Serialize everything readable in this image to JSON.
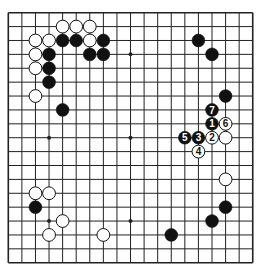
{
  "board": {
    "size": 19,
    "origin_x": 8.3,
    "origin_y": 12.7,
    "spacing_x": 13.58,
    "spacing_y": 13.89,
    "line_color": "#222222",
    "border_width": 1.6,
    "line_width": 1.0,
    "background": "#ffffff",
    "stone_radius": 6.4
  },
  "hoshi": [
    {
      "col": 3,
      "row": 3
    },
    {
      "col": 9,
      "row": 3
    },
    {
      "col": 15,
      "row": 3
    },
    {
      "col": 3,
      "row": 9
    },
    {
      "col": 9,
      "row": 9
    },
    {
      "col": 15,
      "row": 9
    },
    {
      "col": 3,
      "row": 15
    },
    {
      "col": 9,
      "row": 15
    },
    {
      "col": 15,
      "row": 15
    }
  ],
  "colors": {
    "black_stone": "#111111",
    "white_stone": "#ffffff",
    "white_stroke": "#111111",
    "black_label": "#ffffff",
    "white_label": "#111111"
  },
  "stones": [
    {
      "color": "white",
      "col": 4,
      "row": 1,
      "label": ""
    },
    {
      "color": "white",
      "col": 5,
      "row": 1,
      "label": ""
    },
    {
      "color": "white",
      "col": 6,
      "row": 1,
      "label": ""
    },
    {
      "color": "white",
      "col": 2,
      "row": 2,
      "label": ""
    },
    {
      "color": "white",
      "col": 3,
      "row": 2,
      "label": ""
    },
    {
      "color": "black",
      "col": 4,
      "row": 2,
      "label": ""
    },
    {
      "color": "black",
      "col": 5,
      "row": 2,
      "label": ""
    },
    {
      "color": "white",
      "col": 6,
      "row": 2,
      "label": ""
    },
    {
      "color": "black",
      "col": 7,
      "row": 2,
      "label": ""
    },
    {
      "color": "white",
      "col": 2,
      "row": 3,
      "label": ""
    },
    {
      "color": "black",
      "col": 3,
      "row": 3,
      "label": ""
    },
    {
      "color": "black",
      "col": 6,
      "row": 3,
      "label": ""
    },
    {
      "color": "black",
      "col": 7,
      "row": 3,
      "label": ""
    },
    {
      "color": "white",
      "col": 2,
      "row": 4,
      "label": ""
    },
    {
      "color": "black",
      "col": 3,
      "row": 4,
      "label": ""
    },
    {
      "color": "black",
      "col": 3,
      "row": 5,
      "label": ""
    },
    {
      "color": "white",
      "col": 2,
      "row": 6,
      "label": ""
    },
    {
      "color": "black",
      "col": 4,
      "row": 7,
      "label": ""
    },
    {
      "color": "black",
      "col": 14,
      "row": 2,
      "label": ""
    },
    {
      "color": "black",
      "col": 15,
      "row": 3,
      "label": ""
    },
    {
      "color": "black",
      "col": 16,
      "row": 6,
      "label": ""
    },
    {
      "color": "black",
      "col": 15,
      "row": 7,
      "label": "7"
    },
    {
      "color": "black",
      "col": 15,
      "row": 8,
      "label": "1"
    },
    {
      "color": "white",
      "col": 16,
      "row": 8,
      "label": "6"
    },
    {
      "color": "black",
      "col": 13,
      "row": 9,
      "label": "5"
    },
    {
      "color": "black",
      "col": 14,
      "row": 9,
      "label": "3"
    },
    {
      "color": "white",
      "col": 15,
      "row": 9,
      "label": "2"
    },
    {
      "color": "white",
      "col": 16,
      "row": 9,
      "label": ""
    },
    {
      "color": "white",
      "col": 14,
      "row": 10,
      "label": "4"
    },
    {
      "color": "white",
      "col": 16,
      "row": 12,
      "label": ""
    },
    {
      "color": "black",
      "col": 16,
      "row": 14,
      "label": ""
    },
    {
      "color": "black",
      "col": 15,
      "row": 15,
      "label": ""
    },
    {
      "color": "black",
      "col": 12,
      "row": 16,
      "label": ""
    },
    {
      "color": "white",
      "col": 2,
      "row": 13,
      "label": ""
    },
    {
      "color": "white",
      "col": 3,
      "row": 13,
      "label": ""
    },
    {
      "color": "black",
      "col": 2,
      "row": 14,
      "label": ""
    },
    {
      "color": "white",
      "col": 4,
      "row": 15,
      "label": ""
    },
    {
      "color": "white",
      "col": 3,
      "row": 16,
      "label": ""
    },
    {
      "color": "white",
      "col": 7,
      "row": 16,
      "label": ""
    }
  ]
}
